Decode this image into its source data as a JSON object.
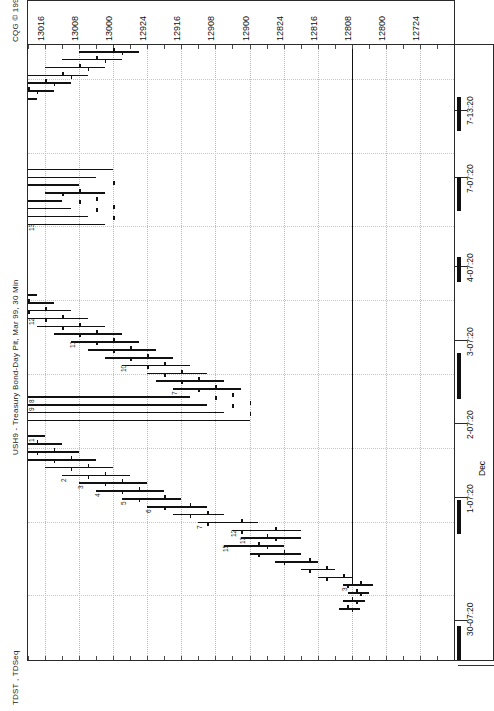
{
  "window": {
    "copyright": "CQG © 1999",
    "instrument_title": "USH9 - Treasury Bond-Day Pit, Mar 99, 30 Min",
    "study_label": "TDST , TDSeq"
  },
  "price_axis": {
    "labels": [
      "13016",
      "13008",
      "13000",
      "12924",
      "12916",
      "12908",
      "12900",
      "12824",
      "12816",
      "12808",
      "12800",
      "12724"
    ],
    "orientation": "horizontal-top",
    "tick_interval_label": "8 ticks (32nds)"
  },
  "time_axis": {
    "labels": [
      "30-07:20",
      "1-07:20",
      "Dec",
      "2-07:20",
      "3-07:20",
      "4-07:20",
      "7-07:20",
      "7-13:20"
    ],
    "orientation": "vertical-right",
    "month_marker": "Dec"
  },
  "chart_data": {
    "type": "bar",
    "subtype": "ohlc-bar-rotated",
    "title": "USH9 - Treasury Bond-Day Pit, Mar 99, 30 Min",
    "xlabel": "Price (32nds)",
    "ylabel": "Time",
    "grid": true,
    "legend": null,
    "xlim": [
      12716,
      13020
    ],
    "price_ticks": [
      13016,
      13008,
      13000,
      12924,
      12916,
      12908,
      12900,
      12824,
      12816,
      12808,
      12800,
      12724
    ],
    "time_ticks": [
      "30-07:20",
      "1-07:20",
      "2-07:20",
      "3-07:20",
      "4-07:20",
      "7-07:20",
      "7-13:20"
    ],
    "annotations": {
      "tdst_line_price": 12808,
      "tdst_line_label": "TDST support",
      "td_sequential_counts_visible": [
        "1",
        "2",
        "3",
        "4",
        "5",
        "6",
        "7",
        "8",
        "9",
        "10",
        "11",
        "12",
        "13"
      ]
    },
    "bars": [
      {
        "t": 0,
        "o": 12809,
        "h": 12811,
        "l": 12806,
        "c": 12808,
        "td": ""
      },
      {
        "t": 1,
        "o": 12808,
        "h": 12810,
        "l": 12805,
        "c": 12807,
        "td": ""
      },
      {
        "t": 2,
        "o": 12807,
        "h": 12809,
        "l": 12804,
        "c": 12806,
        "td": ""
      },
      {
        "t": 3,
        "o": 12806,
        "h": 12810,
        "l": 12803,
        "c": 12809,
        "td": "3"
      },
      {
        "t": 4,
        "o": 12810,
        "h": 12816,
        "l": 12808,
        "c": 12814,
        "td": ""
      },
      {
        "t": 5,
        "o": 12814,
        "h": 12820,
        "l": 12812,
        "c": 12818,
        "td": ""
      },
      {
        "t": 6,
        "o": 12818,
        "h": 12826,
        "l": 12816,
        "c": 12824,
        "td": ""
      },
      {
        "t": 7,
        "o": 12824,
        "h": 12832,
        "l": 12820,
        "c": 12830,
        "td": ""
      },
      {
        "t": 8,
        "o": 12830,
        "h": 12838,
        "l": 12824,
        "c": 12828,
        "td": "15"
      },
      {
        "t": 9,
        "o": 12828,
        "h": 12834,
        "l": 12820,
        "c": 12826,
        "td": "13"
      },
      {
        "t": 10,
        "o": 12826,
        "h": 12836,
        "l": 12820,
        "c": 12834,
        "td": "12"
      },
      {
        "t": 11,
        "o": 12834,
        "h": 12844,
        "l": 12830,
        "c": 12842,
        "td": "7"
      },
      {
        "t": 12,
        "o": 12842,
        "h": 12850,
        "l": 12838,
        "c": 12846,
        "td": ""
      },
      {
        "t": 13,
        "o": 12846,
        "h": 12856,
        "l": 12842,
        "c": 12852,
        "td": "6"
      },
      {
        "t": 14,
        "o": 12852,
        "h": 12862,
        "l": 12848,
        "c": 12858,
        "td": "5"
      },
      {
        "t": 15,
        "o": 12858,
        "h": 12868,
        "l": 12852,
        "c": 12862,
        "td": "4"
      },
      {
        "t": 16,
        "o": 12862,
        "h": 12872,
        "l": 12856,
        "c": 12866,
        "td": "3"
      },
      {
        "t": 17,
        "o": 12866,
        "h": 12876,
        "l": 12860,
        "c": 12870,
        "td": "2"
      },
      {
        "t": 18,
        "o": 12870,
        "h": 12880,
        "l": 12864,
        "c": 12874,
        "td": ""
      },
      {
        "t": 19,
        "o": 12874,
        "h": 12884,
        "l": 12868,
        "c": 12878,
        "td": ""
      },
      {
        "t": 20,
        "o": 12878,
        "h": 12888,
        "l": 12872,
        "c": 12882,
        "td": ""
      },
      {
        "t": 21,
        "o": 12882,
        "h": 12892,
        "l": 12876,
        "c": 12886,
        "td": ""
      },
      {
        "t": 22,
        "o": 12886,
        "h": 12896,
        "l": 12880,
        "c": 12890,
        "td": "1"
      },
      {
        "t": 23,
        "o": 12890,
        "h": 12898,
        "l": 12884,
        "c": 12892,
        "td": ""
      },
      {
        "t": 24,
        "o": 12892,
        "h": 12900,
        "l": 12886,
        "c": 12896,
        "td": ""
      },
      {
        "t": 25,
        "o": 12896,
        "h": 12906,
        "l": 12890,
        "c": 12900,
        "td": ""
      },
      {
        "t": 26,
        "o": 12900,
        "h": 12910,
        "l": 12894,
        "c": 12904,
        "td": "9"
      },
      {
        "t": 27,
        "o": 12904,
        "h": 12914,
        "l": 12898,
        "c": 12908,
        "td": "8"
      },
      {
        "t": 28,
        "o": 12908,
        "h": 12918,
        "l": 12902,
        "c": 12912,
        "td": "7"
      },
      {
        "t": 29,
        "o": 12912,
        "h": 12922,
        "l": 12906,
        "c": 12916,
        "td": ""
      },
      {
        "t": 30,
        "o": 12916,
        "h": 12924,
        "l": 12910,
        "c": 12920,
        "td": ""
      },
      {
        "t": 31,
        "o": 12920,
        "h": 12930,
        "l": 12914,
        "c": 12924,
        "td": "10"
      },
      {
        "t": 32,
        "o": 12924,
        "h": 12934,
        "l": 12918,
        "c": 12928,
        "td": ""
      },
      {
        "t": 33,
        "o": 12928,
        "h": 12938,
        "l": 12922,
        "c": 12932,
        "td": ""
      },
      {
        "t": 34,
        "o": 12932,
        "h": 12942,
        "l": 12926,
        "c": 12936,
        "td": "11"
      },
      {
        "t": 35,
        "o": 12936,
        "h": 12946,
        "l": 12930,
        "c": 12940,
        "td": ""
      },
      {
        "t": 36,
        "o": 12940,
        "h": 12950,
        "l": 12934,
        "c": 12944,
        "td": ""
      },
      {
        "t": 37,
        "o": 12944,
        "h": 12954,
        "l": 12938,
        "c": 12948,
        "td": "12"
      },
      {
        "t": 38,
        "o": 12948,
        "h": 12958,
        "l": 12942,
        "c": 12952,
        "td": ""
      },
      {
        "t": 39,
        "o": 12952,
        "h": 12962,
        "l": 12946,
        "c": 12956,
        "td": ""
      },
      {
        "t": 40,
        "o": 12956,
        "h": 12966,
        "l": 12950,
        "c": 12960,
        "td": ""
      },
      {
        "t": 41,
        "o": 12960,
        "h": 12970,
        "l": 12954,
        "c": 12964,
        "td": ""
      },
      {
        "t": 42,
        "o": 12964,
        "h": 12974,
        "l": 12958,
        "c": 12968,
        "td": ""
      },
      {
        "t": 43,
        "o": 12968,
        "h": 12978,
        "l": 12962,
        "c": 12972,
        "td": ""
      },
      {
        "t": 44,
        "o": 12972,
        "h": 12982,
        "l": 12966,
        "c": 12976,
        "td": ""
      },
      {
        "t": 45,
        "o": 12976,
        "h": 12986,
        "l": 12970,
        "c": 12980,
        "td": ""
      },
      {
        "t": 46,
        "o": 12980,
        "h": 12990,
        "l": 12974,
        "c": 12984,
        "td": ""
      },
      {
        "t": 47,
        "o": 12984,
        "h": 12994,
        "l": 12978,
        "c": 12988,
        "td": ""
      },
      {
        "t": 48,
        "o": 12988,
        "h": 12998,
        "l": 12982,
        "c": 12992,
        "td": ""
      },
      {
        "t": 49,
        "o": 12992,
        "h": 13002,
        "l": 12986,
        "c": 12996,
        "td": "13"
      },
      {
        "t": 50,
        "o": 12996,
        "h": 13006,
        "l": 12990,
        "c": 13000,
        "td": ""
      },
      {
        "t": 51,
        "o": 13000,
        "h": 13010,
        "l": 12994,
        "c": 13004,
        "td": ""
      },
      {
        "t": 52,
        "o": 13004,
        "h": 13012,
        "l": 12998,
        "c": 13008,
        "td": ""
      },
      {
        "t": 53,
        "o": 13008,
        "h": 13016,
        "l": 13002,
        "c": 13012,
        "td": ""
      },
      {
        "t": 54,
        "o": 13000,
        "h": 13008,
        "l": 12994,
        "c": 12998,
        "td": ""
      },
      {
        "t": 55,
        "o": 12996,
        "h": 13004,
        "l": 12990,
        "c": 12994,
        "td": ""
      },
      {
        "t": 56,
        "o": 12992,
        "h": 13000,
        "l": 12986,
        "c": 12990,
        "td": ""
      },
      {
        "t": 57,
        "o": 12988,
        "h": 12996,
        "l": 12982,
        "c": 12986,
        "td": ""
      },
      {
        "t": 58,
        "o": 12984,
        "h": 12992,
        "l": 12978,
        "c": 12982,
        "td": ""
      },
      {
        "t": 59,
        "o": 12980,
        "h": 12988,
        "l": 12974,
        "c": 12978,
        "td": ""
      },
      {
        "t": 60,
        "o": 12976,
        "h": 12984,
        "l": 12970,
        "c": 12974,
        "td": ""
      },
      {
        "t": 61,
        "o": 12972,
        "h": 12980,
        "l": 12966,
        "c": 12970,
        "td": ""
      },
      {
        "t": 62,
        "o": 12968,
        "h": 12976,
        "l": 12962,
        "c": 12966,
        "td": ""
      },
      {
        "t": 63,
        "o": 12964,
        "h": 12972,
        "l": 12958,
        "c": 12962,
        "td": ""
      },
      {
        "t": 64,
        "o": 12960,
        "h": 12968,
        "l": 12954,
        "c": 12958,
        "td": ""
      },
      {
        "t": 65,
        "o": 12956,
        "h": 12964,
        "l": 12950,
        "c": 12954,
        "td": ""
      },
      {
        "t": 66,
        "o": 12952,
        "h": 12960,
        "l": 12946,
        "c": 12950,
        "td": ""
      },
      {
        "t": 67,
        "o": 12948,
        "h": 12956,
        "l": 12942,
        "c": 12946,
        "td": ""
      },
      {
        "t": 68,
        "o": 12944,
        "h": 12952,
        "l": 12938,
        "c": 12942,
        "td": ""
      },
      {
        "t": 69,
        "o": 12940,
        "h": 12948,
        "l": 12934,
        "c": 12938,
        "td": ""
      },
      {
        "t": 70,
        "o": 12936,
        "h": 12944,
        "l": 12930,
        "c": 12934,
        "td": ""
      },
      {
        "t": 71,
        "o": 12932,
        "h": 12940,
        "l": 12926,
        "c": 12930,
        "td": ""
      }
    ]
  }
}
